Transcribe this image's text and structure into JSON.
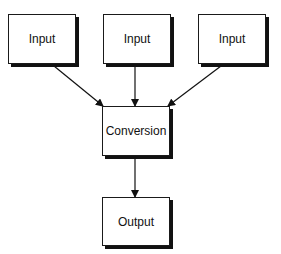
{
  "diagram": {
    "nodes": [
      {
        "id": "input1",
        "label": "Input"
      },
      {
        "id": "input2",
        "label": "Input"
      },
      {
        "id": "input3",
        "label": "Input"
      },
      {
        "id": "conversion",
        "label": "Conversion"
      },
      {
        "id": "output",
        "label": "Output"
      }
    ],
    "edges": [
      {
        "from": "input1",
        "to": "conversion"
      },
      {
        "from": "input2",
        "to": "conversion"
      },
      {
        "from": "input3",
        "to": "conversion"
      },
      {
        "from": "conversion",
        "to": "output"
      }
    ]
  }
}
